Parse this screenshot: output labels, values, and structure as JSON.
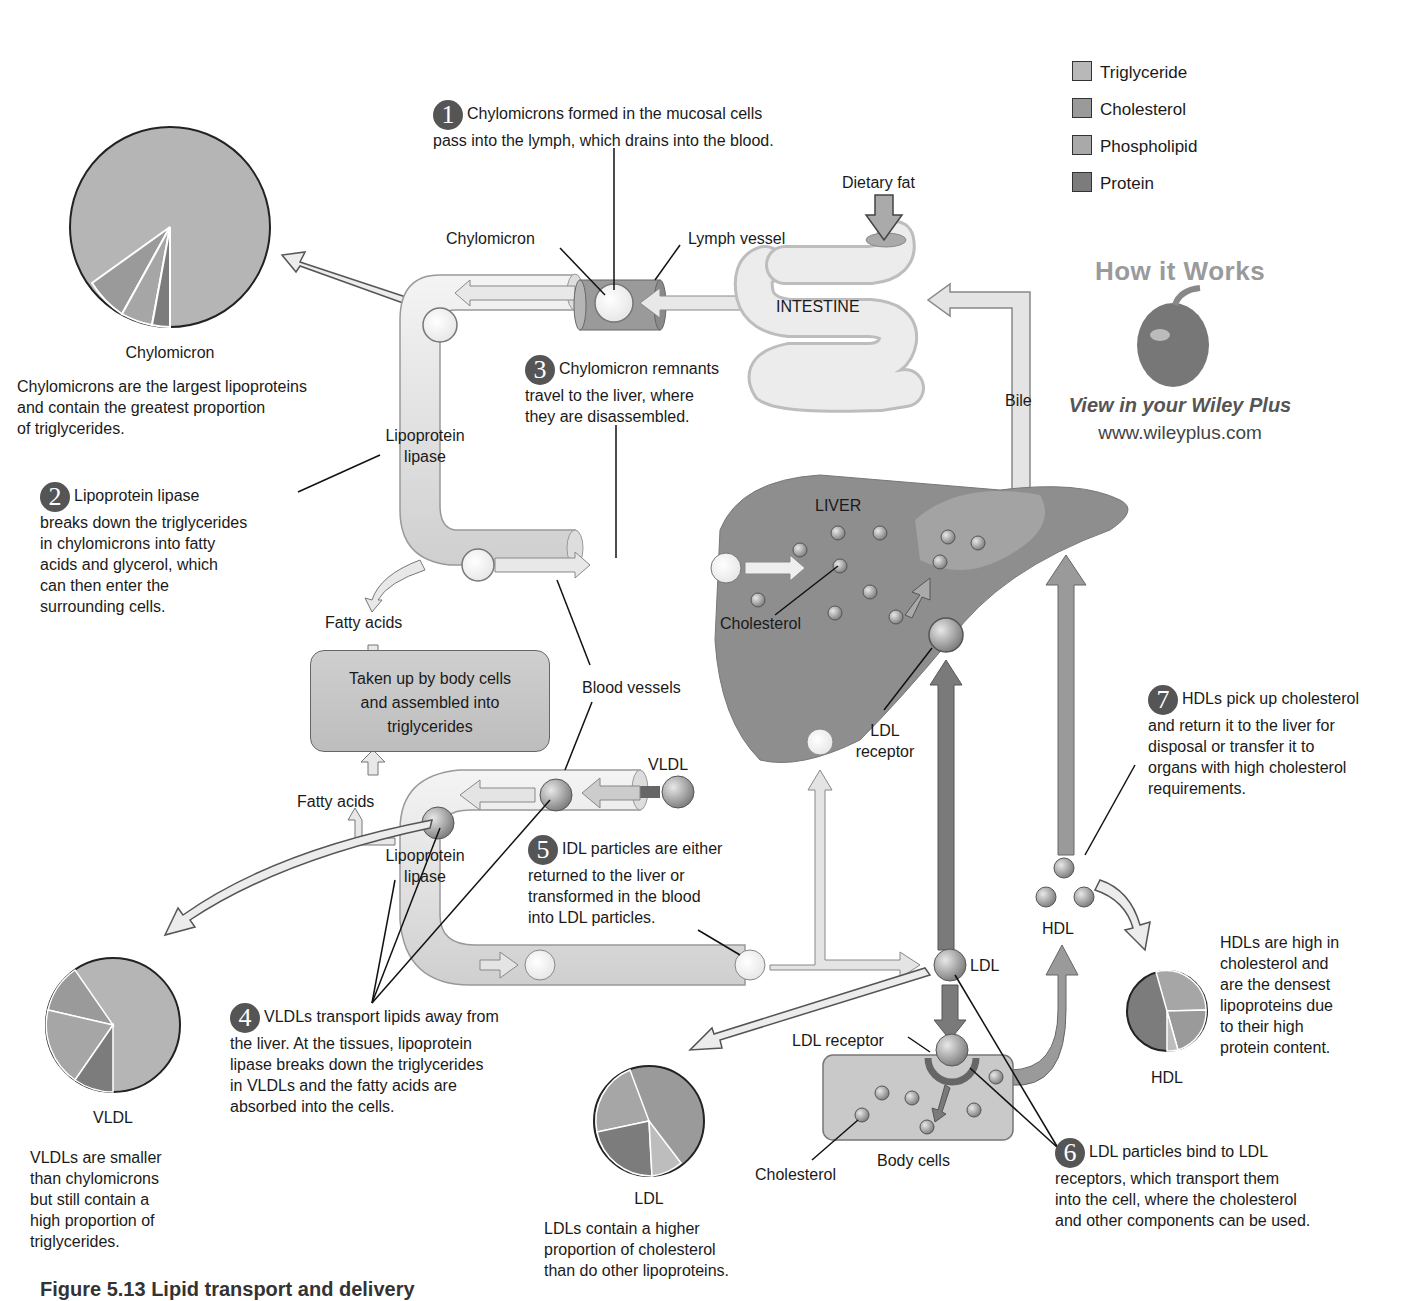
{
  "legend": {
    "items": [
      {
        "label": "Triglyceride",
        "color": "#b8b8b8"
      },
      {
        "label": "Cholesterol",
        "color": "#9a9a9a"
      },
      {
        "label": "Phospholipid",
        "color": "#a9a9a9"
      },
      {
        "label": "Protein",
        "color": "#7c7c7c"
      }
    ]
  },
  "promo": {
    "title": "How it Works",
    "subtitle": "View in your Wiley Plus",
    "url": "www.wileyplus.com"
  },
  "labels": {
    "dietary_fat": "Dietary fat",
    "chylomicron": "Chylomicron",
    "lymph_vessel": "Lymph vessel",
    "intestine": "INTESTINE",
    "bile": "Bile",
    "lipoprotein_lipase_top": "Lipoprotein\nlipase",
    "lipoprotein_lipase_bottom": "Lipoprotein\nlipase",
    "liver": "LIVER",
    "cholesterol_liver": "Cholesterol",
    "ldl_receptor_liver": "LDL\nreceptor",
    "fatty_acids_top": "Fatty acids",
    "fatty_acids_bottom": "Fatty acids",
    "body_cells_box": "Taken up by body cells\nand assembled into\ntriglycerides",
    "blood_vessels": "Blood vessels",
    "vldl": "VLDL",
    "ldl": "LDL",
    "hdl": "HDL",
    "ldl_receptor_cell": "LDL receptor",
    "body_cells": "Body cells",
    "cholesterol_cell": "Cholesterol"
  },
  "steps": [
    {
      "num": "1",
      "text": "Chylomicrons formed in the mucosal cells\npass into the lymph, which drains into the blood."
    },
    {
      "num": "2",
      "text": "Lipoprotein lipase\nbreaks down the triglycerides\nin chylomicrons into fatty\nacids and glycerol, which\ncan then enter the\nsurrounding cells."
    },
    {
      "num": "3",
      "text": "Chylomicron remnants\ntravel to the liver, where\nthey are disassembled."
    },
    {
      "num": "4",
      "text": "VLDLs transport lipids away from\nthe liver. At the tissues, lipoprotein\nlipase breaks down the triglycerides\nin VLDLs and the fatty acids are\nabsorbed into the cells."
    },
    {
      "num": "5",
      "text": "IDL particles are either\nreturned to the liver or\ntransformed in the blood\ninto LDL particles."
    },
    {
      "num": "6",
      "text": "LDL particles bind to LDL\nreceptors, which transport them\ninto the cell, where the cholesterol\nand other components can be used."
    },
    {
      "num": "7",
      "text": "HDLs pick up cholesterol\nand return it to the liver for\ndisposal or transfer it to\norgans with high cholesterol\nrequirements."
    }
  ],
  "pies": [
    {
      "name": "Chylomicron",
      "description": "Chylomicrons are the largest lipoproteins\nand contain the greatest proportion\nof triglycerides.",
      "slices": [
        {
          "component": "Triglyceride",
          "pct": 84
        },
        {
          "component": "Cholesterol",
          "pct": 7
        },
        {
          "component": "Phospholipid",
          "pct": 6
        },
        {
          "component": "Protein",
          "pct": 3
        }
      ]
    },
    {
      "name": "VLDL",
      "description": "VLDLs are smaller\nthan chylomicrons\nbut still contain a\nhigh proportion of\ntriglycerides.",
      "slices": [
        {
          "component": "Triglyceride",
          "pct": 56
        },
        {
          "component": "Cholesterol",
          "pct": 16
        },
        {
          "component": "Phospholipid",
          "pct": 18
        },
        {
          "component": "Protein",
          "pct": 10
        }
      ]
    },
    {
      "name": "LDL",
      "description": "LDLs contain a higher\nproportion of cholesterol\nthan do other lipoproteins.",
      "slices": [
        {
          "component": "Cholesterol",
          "pct": 43
        },
        {
          "component": "Phospholipid",
          "pct": 22
        },
        {
          "component": "Protein",
          "pct": 25
        },
        {
          "component": "Triglyceride",
          "pct": 10
        }
      ]
    },
    {
      "name": "HDL",
      "description": "HDLs are high in\ncholesterol and\nare the densest\nlipoproteins due\nto their high\nprotein content.",
      "slices": [
        {
          "component": "Cholesterol",
          "pct": 20
        },
        {
          "component": "Phospholipid",
          "pct": 25
        },
        {
          "component": "Triglyceride",
          "pct": 5
        },
        {
          "component": "Protein",
          "pct": 50
        }
      ]
    }
  ],
  "caption": "Figure 5.13 Lipid transport and delivery"
}
